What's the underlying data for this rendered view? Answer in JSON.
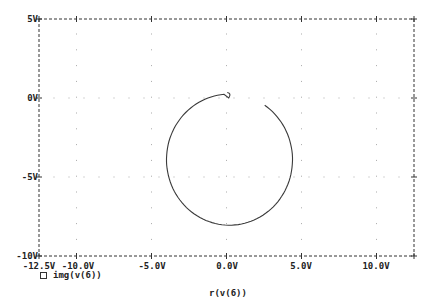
{
  "chart_data": {
    "type": "line",
    "title": "",
    "xlabel": "r(v(6))",
    "ylabel": "",
    "xlim": [
      -12.5,
      12.5
    ],
    "ylim": [
      -10,
      5
    ],
    "x_ticks": [
      "-12.5V",
      "-10.0V",
      "-5.0V",
      "0.0V",
      "5.0V",
      "10.0V"
    ],
    "x_tick_values": [
      -12.5,
      -10,
      -5,
      0,
      5,
      10
    ],
    "y_ticks": [
      "5V",
      "0V",
      "-5V",
      "-10V"
    ],
    "y_tick_values": [
      5,
      0,
      -5,
      -10
    ],
    "grid": "dotted",
    "legend": [
      {
        "marker": "square",
        "label": "img(v(6))"
      }
    ],
    "series": [
      {
        "name": "img(v(6))",
        "description": "Near-circular Nyquist-style trace centered at about (0.2V, -3.9V) with radius about 4.2V; gap in top-right between ~(0V,0V) and ~(2V,-0.2V), small hook at start near (0V,0.3V)",
        "center": [
          0.2,
          -3.9
        ],
        "radius_x": 4.2,
        "radius_y": 4.15,
        "points": [
          [
            0.05,
            0.35
          ],
          [
            0.2,
            0.25
          ],
          [
            0.1,
            -0.05
          ],
          [
            -1.0,
            -0.3
          ],
          [
            -2.2,
            -0.9
          ],
          [
            -3.2,
            -1.8
          ],
          [
            -3.8,
            -2.9
          ],
          [
            -4.0,
            -3.9
          ],
          [
            -3.8,
            -5.1
          ],
          [
            -3.2,
            -6.2
          ],
          [
            -2.2,
            -7.2
          ],
          [
            -1.0,
            -7.9
          ],
          [
            0.3,
            -8.1
          ],
          [
            1.6,
            -7.8
          ],
          [
            2.7,
            -7.1
          ],
          [
            3.6,
            -6.1
          ],
          [
            4.2,
            -5.0
          ],
          [
            4.4,
            -3.9
          ],
          [
            4.2,
            -2.8
          ],
          [
            3.6,
            -1.6
          ],
          [
            2.9,
            -0.8
          ],
          [
            2.0,
            -0.15
          ]
        ]
      }
    ]
  },
  "axes": {
    "y_labels": [
      "5V",
      "0V",
      "-5V",
      "-10V"
    ],
    "x_labels": [
      "-12.5V",
      "-10.0V",
      "-5.0V",
      "0.0V",
      "5.0V",
      "10.0V"
    ],
    "x_title": "r(v(6))"
  },
  "legend": {
    "label": "img(v(6))"
  }
}
